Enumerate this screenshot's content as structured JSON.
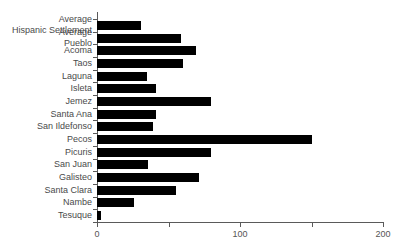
{
  "chart_data": {
    "type": "bar",
    "orientation": "horizontal",
    "title": "",
    "xlabel": "",
    "ylabel": "",
    "xlim": [
      0,
      200
    ],
    "grid": false,
    "legend": null,
    "xticks": [
      0,
      50,
      100,
      150,
      200
    ],
    "xtick_labels": [
      "0",
      "",
      "100",
      "",
      "200"
    ],
    "bar_color": "#000000",
    "axis_color": "#555555",
    "categories": [
      "Average Hispanic Settlement",
      "Average Pueblo",
      "Acoma",
      "Taos",
      "Laguna",
      "Isleta",
      "Jemez",
      "Santa Ana",
      "San Ildefonso",
      "Pecos",
      "Picuris",
      "San Juan",
      "Galisteo",
      "Santa Clara",
      "Nambe",
      "Tesuque"
    ],
    "category_lines": [
      [
        "Average",
        "Hispanic Settlement"
      ],
      [
        "Average",
        "Pueblo"
      ],
      [
        "Acoma",
        ""
      ],
      [
        "Taos",
        ""
      ],
      [
        "Laguna",
        ""
      ],
      [
        "Isleta",
        ""
      ],
      [
        "Jemez",
        ""
      ],
      [
        "Santa Ana",
        ""
      ],
      [
        "San Ildefonso",
        ""
      ],
      [
        "Pecos",
        ""
      ],
      [
        "Picuris",
        ""
      ],
      [
        "San Juan",
        ""
      ],
      [
        "Galisteo",
        ""
      ],
      [
        "Santa Clara",
        ""
      ],
      [
        "Nambe",
        ""
      ],
      [
        "Tesuque",
        ""
      ]
    ],
    "values": [
      31,
      59,
      69,
      60,
      35,
      41,
      80,
      41,
      39,
      150,
      80,
      36,
      71,
      55,
      26,
      3
    ]
  }
}
